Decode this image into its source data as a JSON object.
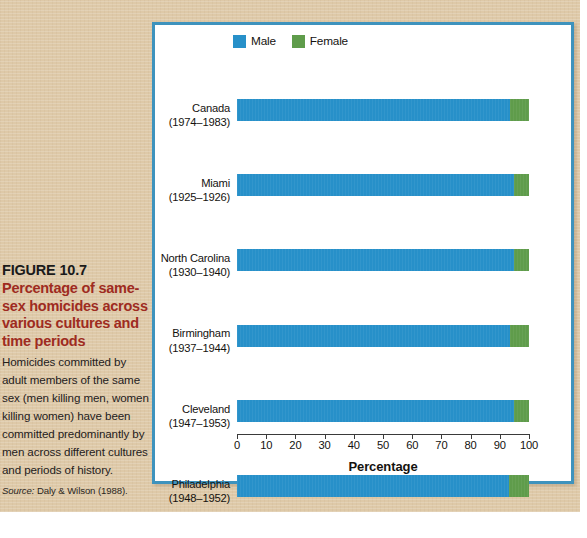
{
  "caption": {
    "figure_number": "FIGURE 10.7",
    "title": "Percentage of same-sex homicides across various cultures and time periods",
    "description": "Homicides committed by adult members of the same sex (men killing men, women killing women) have been committed predominantly by men across different cultures and periods of history.",
    "source_label": "Source:",
    "source_text": " Daly & Wilson (1988)."
  },
  "colors": {
    "male": "#2790c9",
    "female": "#5f9c4b",
    "panel_border": "#3e93bd",
    "page_background": "#dec9a8",
    "title_red": "#9e2b21"
  },
  "chart_data": {
    "type": "bar",
    "orientation": "horizontal",
    "stacked": true,
    "title": "",
    "xlabel": "Percentage",
    "ylabel": "",
    "xlim": [
      0,
      100
    ],
    "xticks": [
      "0",
      "10",
      "20",
      "30",
      "40",
      "50",
      "60",
      "70",
      "80",
      "90",
      "100"
    ],
    "grid": false,
    "legend_position": "top-center",
    "categories": [
      "Canada\n(1974–1983)",
      "Miami\n(1925–1926)",
      "North Carolina\n(1930–1940)",
      "Birmingham\n(1937–1944)",
      "Cleveland\n(1947–1953)",
      "Philadelphia\n(1948–1952)",
      "Tzeltal Mayans\n(1938–1965)",
      "Belo Horizonte\n(1961–1965)",
      "New South Wales\n(1968–1981)",
      "Oxford, England\n(1296–1398)",
      "Denmark\n(1933–1961)",
      "Scotland\n(1953–1974)"
    ],
    "category_places": [
      "Canada",
      "Miami",
      "North Carolina",
      "Birmingham",
      "Cleveland",
      "Philadelphia",
      "Tzeltal Mayans",
      "Belo Horizonte",
      "New South Wales",
      "Oxford, England",
      "Denmark",
      "Scotland"
    ],
    "category_years": [
      "(1974–1983)",
      "(1925–1926)",
      "(1930–1940)",
      "(1937–1944)",
      "(1947–1953)",
      "(1948–1952)",
      "(1938–1965)",
      "(1961–1965)",
      "(1968–1981)",
      "(1296–1398)",
      "(1933–1961)",
      "(1953–1974)"
    ],
    "series": [
      {
        "name": "Male",
        "color": "#2790c9",
        "values": [
          93.5,
          95,
          95,
          93.5,
          95,
          93,
          97,
          92.5,
          90,
          95,
          85.5,
          93.5
        ]
      },
      {
        "name": "Female",
        "color": "#5f9c4b",
        "values": [
          6.5,
          5,
          5,
          6.5,
          5,
          7,
          3,
          7.5,
          10,
          5,
          14.5,
          6.5
        ]
      }
    ]
  },
  "legend": {
    "items": [
      {
        "label": "Male",
        "color": "#2790c9"
      },
      {
        "label": "Female",
        "color": "#5f9c4b"
      }
    ]
  }
}
